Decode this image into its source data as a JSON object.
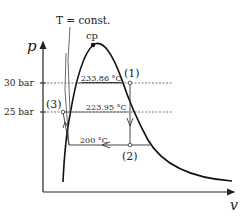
{
  "diagram": {
    "type": "p-v diagram (vapor dome with throttling / isotherm process)",
    "axes": {
      "y_label": "p",
      "x_label": "v"
    },
    "isotherm_label": "T = const.",
    "critical_point_label": "cp",
    "pressure_levels": [
      {
        "label": "30 bar",
        "temperature_label": "233.86 °C"
      },
      {
        "label": "25 bar",
        "temperature_label": "223.95 °C"
      }
    ],
    "lower_temperature_label": "200 °C",
    "states": [
      {
        "label": "(1)"
      },
      {
        "label": "(2)"
      },
      {
        "label": "(3)"
      }
    ]
  }
}
